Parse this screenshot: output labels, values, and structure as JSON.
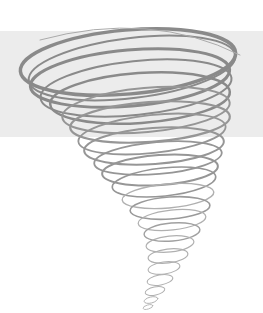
{
  "image": {
    "subject": "tornado spiral illustration",
    "background_color": "#ffffff",
    "band_color": "#ececec",
    "stroke_color": "#8c8c8c",
    "light_stroke_color": "#b4b4b4"
  }
}
